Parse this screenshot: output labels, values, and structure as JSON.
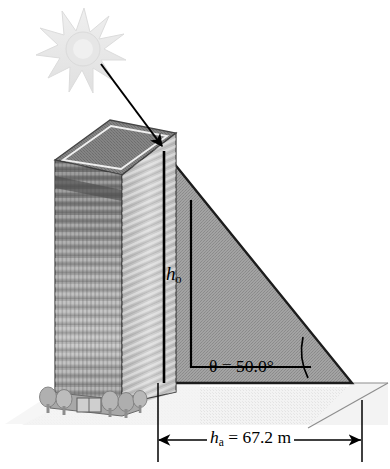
{
  "figure": {
    "domain": "diagram",
    "background_color": "#ffffff"
  },
  "labels": {
    "height_opposite": {
      "symbol": "h",
      "subscript": "o",
      "name": "height-of-building-label"
    },
    "angle": {
      "text": "θ = 50.0°",
      "symbol": "θ",
      "equals": "=",
      "value": "50.0",
      "unit": "°",
      "name": "elevation-angle-label"
    },
    "shadow_length": {
      "symbol": "h",
      "subscript": "a",
      "text": " = 67.2 m",
      "value": "67.2",
      "unit": "m",
      "name": "shadow-length-label"
    }
  },
  "elements": {
    "sun": {
      "name": "sun-icon",
      "color": "#e8e8e8",
      "stroke": "#d8d8d8",
      "center_x": 84,
      "center_y": 48,
      "points": 12
    },
    "sun_ray": {
      "name": "sun-ray-arrow",
      "color": "#000000",
      "from_x": 100,
      "from_y": 63,
      "to_x": 164,
      "to_y": 148
    },
    "building": {
      "name": "building-illustration",
      "roof_color": "#7d7d7d",
      "front_face_color": "#9b9b9b",
      "side_face_color": "#c9c9c9",
      "outline_color": "#3a3a3a",
      "floors": 26
    },
    "shadow_triangle": {
      "name": "shadow-triangle",
      "fill": "#9a9a9a",
      "stroke": "#1a1a1a",
      "apex_x": 164,
      "apex_y": 151,
      "base_left_x": 164,
      "base_left_y": 383,
      "base_right_x": 352,
      "base_right_y": 383
    },
    "ground_plane": {
      "name": "ground-plane",
      "fill": "#f0f0f0",
      "stroke": "#9a9a9a"
    },
    "right_angle_leg": {
      "name": "right-angle-corner-marker",
      "color": "#000000"
    },
    "angle_arc": {
      "name": "angle-arc",
      "color": "#000000"
    },
    "dimension_line": {
      "name": "dimension-line-shadow",
      "color": "#000000",
      "left_x": 158,
      "right_x": 362,
      "y": 440
    }
  },
  "colors": {
    "ink": "#000000",
    "shadow_gray": "#9a9a9a",
    "light_gray": "#e8e8e8",
    "ground_gray": "#efefef"
  }
}
